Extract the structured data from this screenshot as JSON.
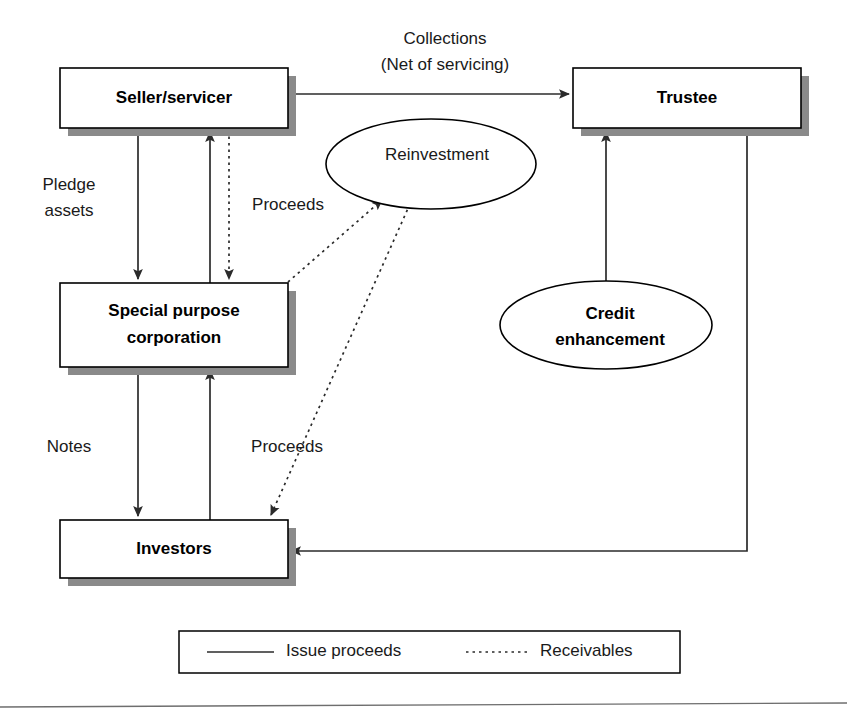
{
  "diagram": {
    "nodes": [
      {
        "id": "seller",
        "label": "Seller/servicer",
        "shape": "box"
      },
      {
        "id": "trustee",
        "label": "Trustee",
        "shape": "box"
      },
      {
        "id": "spc_l1",
        "label": "Special purpose",
        "shape": "box"
      },
      {
        "id": "spc_l2",
        "label": "corporation",
        "shape": "box"
      },
      {
        "id": "investors",
        "label": "Investors",
        "shape": "box"
      },
      {
        "id": "reinvest",
        "label": "Reinvestment",
        "shape": "ellipse"
      },
      {
        "id": "credit_l1",
        "label": "Credit",
        "shape": "ellipse"
      },
      {
        "id": "credit_l2",
        "label": "enhancement",
        "shape": "ellipse"
      }
    ],
    "edge_labels": {
      "collections_line1": "Collections",
      "collections_line2": "(Net of servicing)",
      "pledge_line1": "Pledge",
      "pledge_line2": "assets",
      "proceeds_upper": "Proceeds",
      "notes": "Notes",
      "proceeds_lower": "Proceeds"
    },
    "legend": {
      "items": [
        {
          "style": "solid",
          "label": "Issue proceeds"
        },
        {
          "style": "dotted",
          "label": "Receivables"
        }
      ]
    },
    "colors": {
      "stroke": "#000000",
      "edge": "#2b2b2b",
      "shadow": "#8a8a8a",
      "background": "#ffffff",
      "rule": "#6e6e6e"
    }
  }
}
